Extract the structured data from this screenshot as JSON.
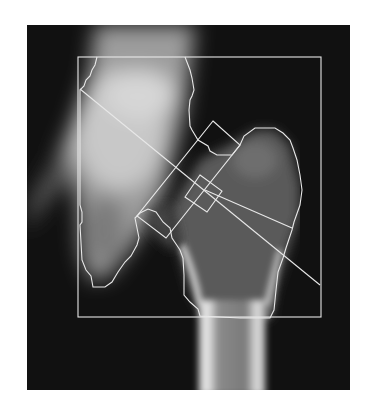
{
  "image": {
    "subject": "DXA hip scan (proximal femur) with analysis regions",
    "background_color": "#ffffff",
    "scan_background_color": "#111111",
    "overlay_color": "#e8e8e8"
  },
  "overlays": [
    {
      "name": "global-roi-box",
      "shape": "rectangle"
    },
    {
      "name": "femur-bone-outline",
      "shape": "polygon"
    },
    {
      "name": "femoral-neck-axis-line",
      "shape": "line"
    },
    {
      "name": "femoral-neck-box",
      "shape": "rotated-rectangle"
    },
    {
      "name": "wards-triangle-box",
      "shape": "rotated-rectangle"
    },
    {
      "name": "trochanter-line",
      "shape": "line"
    }
  ]
}
